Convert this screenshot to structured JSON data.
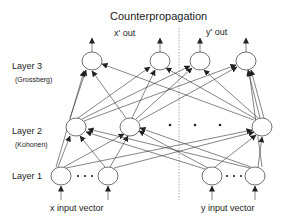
{
  "title": "Counterpropagation",
  "outputs": {
    "x_out": "x' out",
    "y_out": "y' out"
  },
  "layers": [
    {
      "label": "Layer 3",
      "sublabel": "(Grossberg)"
    },
    {
      "label": "Layer 2",
      "sublabel": "(Kohonen)"
    },
    {
      "label": "Layer 1",
      "sublabel": ""
    }
  ],
  "inputs": {
    "x_input": "x input vector",
    "y_input": "y input vector"
  },
  "colors": {
    "line": "#333333",
    "node_fill": "#ffffff",
    "divider": "#888888"
  }
}
